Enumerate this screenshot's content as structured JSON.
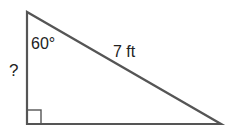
{
  "diagram": {
    "type": "right-triangle",
    "angle_label": "60°",
    "hypotenuse_label": "7 ft",
    "unknown_side_label": "?",
    "right_angle_marker": true,
    "colors": {
      "stroke": "#555555",
      "text": "#222222",
      "background": "#ffffff"
    }
  }
}
